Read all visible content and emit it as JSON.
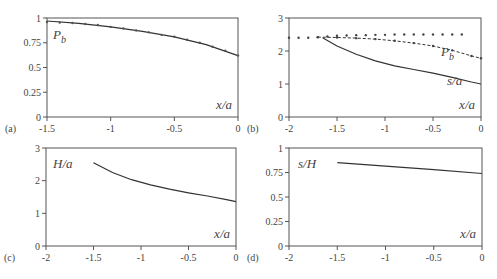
{
  "chart_data": [
    {
      "panel": "(a)",
      "type": "line",
      "xlabel": "x/a",
      "ylabel": "",
      "xlim": [
        -1.5,
        0
      ],
      "ylim": [
        0,
        1
      ],
      "xticks": [
        "-1.5",
        "-1",
        "-0.5",
        "0"
      ],
      "yticks": [
        "0",
        "0.25",
        "0.5",
        "0.75",
        "1"
      ],
      "annotations": [
        "P_b"
      ],
      "series": [
        {
          "name": "P_b (solid)",
          "style": "solid",
          "x": [
            -1.5,
            -1.25,
            -1.0,
            -0.75,
            -0.5,
            -0.25,
            0
          ],
          "y": [
            0.97,
            0.945,
            0.91,
            0.865,
            0.81,
            0.73,
            0.62
          ]
        },
        {
          "name": "P_b (markers)",
          "style": "markers",
          "x": [
            -1.5,
            -1.4,
            -1.3,
            -1.2,
            -1.1,
            -1.0,
            -0.9,
            -0.8,
            -0.7,
            -0.6,
            -0.5,
            -0.4,
            -0.3,
            -0.2,
            -0.1,
            0
          ],
          "y": [
            0.96,
            0.955,
            0.95,
            0.94,
            0.93,
            0.91,
            0.895,
            0.875,
            0.855,
            0.83,
            0.81,
            0.78,
            0.75,
            0.71,
            0.67,
            0.62
          ]
        }
      ]
    },
    {
      "panel": "(b)",
      "type": "line",
      "xlabel": "x/a",
      "ylabel": "",
      "xlim": [
        -2,
        0
      ],
      "ylim": [
        0,
        3
      ],
      "xticks": [
        "-2",
        "-1.5",
        "-1",
        "-0.5",
        "0"
      ],
      "yticks": [
        "0",
        "1",
        "2",
        "3"
      ],
      "annotations": [
        "P_b",
        "s/a"
      ],
      "series": [
        {
          "name": "upper dotted",
          "style": "dotted",
          "x": [
            -2.0,
            -1.9,
            -1.8,
            -1.7,
            -1.6,
            -1.5,
            -1.4,
            -1.3,
            -1.2,
            -1.1,
            -1.0,
            -0.9,
            -0.8,
            -0.7,
            -0.6,
            -0.5,
            -0.4,
            -0.3,
            -0.2
          ],
          "y": [
            2.4,
            2.4,
            2.4,
            2.42,
            2.44,
            2.46,
            2.47,
            2.48,
            2.48,
            2.49,
            2.49,
            2.5,
            2.5,
            2.5,
            2.5,
            2.5,
            2.5,
            2.5,
            2.5
          ]
        },
        {
          "name": "P_b",
          "style": "dashed-markers",
          "x": [
            -1.7,
            -1.5,
            -1.3,
            -1.1,
            -0.9,
            -0.7,
            -0.5,
            -0.3,
            -0.1,
            0
          ],
          "y": [
            2.42,
            2.41,
            2.39,
            2.36,
            2.31,
            2.24,
            2.15,
            2.02,
            1.85,
            1.78
          ]
        },
        {
          "name": "s/a",
          "style": "solid",
          "x": [
            -1.65,
            -1.5,
            -1.3,
            -1.1,
            -0.9,
            -0.7,
            -0.5,
            -0.3,
            -0.1,
            0
          ],
          "y": [
            2.4,
            2.15,
            1.9,
            1.7,
            1.55,
            1.44,
            1.33,
            1.2,
            1.06,
            1.0
          ]
        }
      ]
    },
    {
      "panel": "(c)",
      "type": "line",
      "xlabel": "x/a",
      "ylabel": "H/a",
      "xlim": [
        -2,
        0
      ],
      "ylim": [
        0,
        3
      ],
      "xticks": [
        "-2",
        "-1.5",
        "-1",
        "-0.5",
        "0"
      ],
      "yticks": [
        "0",
        "1",
        "2",
        "3"
      ],
      "series": [
        {
          "name": "H/a",
          "style": "solid",
          "x": [
            -1.5,
            -1.3,
            -1.1,
            -0.9,
            -0.7,
            -0.5,
            -0.3,
            -0.1,
            0
          ],
          "y": [
            2.55,
            2.25,
            2.03,
            1.87,
            1.74,
            1.63,
            1.53,
            1.42,
            1.36
          ]
        }
      ]
    },
    {
      "panel": "(d)",
      "type": "line",
      "xlabel": "x/a",
      "ylabel": "s/H",
      "xlim": [
        -2,
        0
      ],
      "ylim": [
        0,
        1
      ],
      "xticks": [
        "-2",
        "-1.5",
        "-1",
        "-0.5",
        "0"
      ],
      "yticks": [
        "0",
        "0.25",
        "0.5",
        "0.75",
        "1"
      ],
      "series": [
        {
          "name": "s/H",
          "style": "solid",
          "x": [
            -1.5,
            -1.0,
            -0.5,
            0
          ],
          "y": [
            0.85,
            0.815,
            0.78,
            0.74
          ]
        }
      ]
    }
  ],
  "labels": {
    "a": "(a)",
    "b": "(b)",
    "c": "(c)",
    "d": "(d)",
    "xa": "x/a",
    "pb": "P",
    "pb_sub": "b",
    "sa": "s/a",
    "ha": "H/a",
    "sh": "s/H"
  }
}
